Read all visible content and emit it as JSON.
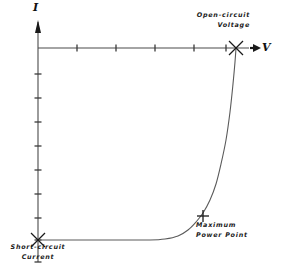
{
  "figure": {
    "kind": "solar-cell-iv-curve",
    "background_color": "#ffffff",
    "line_color": "#4a4a4a",
    "text_color": "#1a1a1a"
  },
  "axes": {
    "y_axis": {
      "label": "I",
      "arrow": "up",
      "x_px": 38,
      "top_px": 22,
      "bottom_px": 262,
      "tick_count": 9,
      "tick_length_px": 7
    },
    "x_axis": {
      "label": "V",
      "arrow": "right",
      "y_px": 48,
      "left_px": 38,
      "right_px": 258,
      "tick_count": 5,
      "tick_length_px": 7
    },
    "origin_px": {
      "x": 38,
      "y": 48
    }
  },
  "annotations": [
    {
      "name": "open-circuit-voltage",
      "lines": [
        "Open-circuit",
        "Voltage"
      ],
      "marker": "x-cross",
      "marker_px": {
        "x": 236,
        "y": 48
      }
    },
    {
      "name": "maximum-power-point",
      "lines": [
        "Maximum",
        "Power Point"
      ],
      "marker": "plus-cross",
      "marker_px": {
        "x": 203,
        "y": 216
      }
    },
    {
      "name": "short-circuit-current",
      "lines": [
        "Short-circuit",
        "Current"
      ],
      "marker": "x-cross",
      "marker_px": {
        "x": 38,
        "y": 240
      }
    }
  ],
  "chart_data": {
    "type": "line",
    "title": "",
    "xlabel": "V",
    "ylabel": "I",
    "grid": false,
    "legend": "none",
    "axis_orientation": {
      "x": "V increases to the right",
      "y": "I increases downward from the V axis in this rendering"
    },
    "x_tick_positions_px": [
      77,
      116,
      155,
      194,
      226
    ],
    "y_tick_positions_px": [
      74,
      98,
      122,
      146,
      170,
      194,
      218,
      240,
      262
    ],
    "key_points": [
      {
        "name": "Short-circuit Current",
        "v": 0.0,
        "i": 1.0,
        "px": {
          "x": 38,
          "y": 240
        }
      },
      {
        "name": "Maximum Power Point",
        "v": 0.75,
        "i": 0.875,
        "px": {
          "x": 203,
          "y": 216
        }
      },
      {
        "name": "Open-circuit Voltage",
        "v": 1.0,
        "i": 0.0,
        "px": {
          "x": 236,
          "y": 48
        }
      }
    ],
    "curve_px": [
      {
        "x": 38,
        "y": 240
      },
      {
        "x": 60,
        "y": 240
      },
      {
        "x": 90,
        "y": 240
      },
      {
        "x": 120,
        "y": 240
      },
      {
        "x": 150,
        "y": 240
      },
      {
        "x": 165,
        "y": 239
      },
      {
        "x": 178,
        "y": 236
      },
      {
        "x": 188,
        "y": 230
      },
      {
        "x": 196,
        "y": 222
      },
      {
        "x": 203,
        "y": 213
      },
      {
        "x": 210,
        "y": 200
      },
      {
        "x": 216,
        "y": 184
      },
      {
        "x": 221,
        "y": 164
      },
      {
        "x": 226,
        "y": 140
      },
      {
        "x": 230,
        "y": 112
      },
      {
        "x": 233,
        "y": 84
      },
      {
        "x": 235,
        "y": 62
      },
      {
        "x": 236,
        "y": 48
      }
    ]
  }
}
